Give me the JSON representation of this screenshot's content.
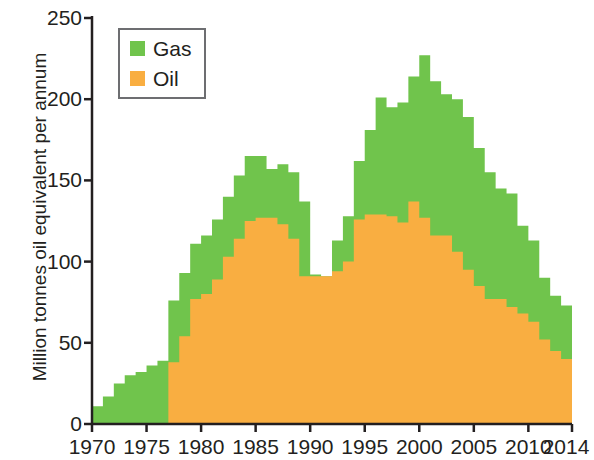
{
  "chart_data": {
    "type": "area",
    "title": "",
    "subtitle": "",
    "xlabel": "",
    "ylabel": "Million tonnes oil equivalent per annum",
    "stacked": true,
    "grid": false,
    "legend_position": "top-left",
    "xlim": [
      1970,
      2014
    ],
    "ylim": [
      0,
      250
    ],
    "ytick_labels": [
      "250",
      "200",
      "150",
      "100",
      "50",
      "0"
    ],
    "ytick_values": [
      250,
      200,
      150,
      100,
      50,
      0
    ],
    "xtick_labels": [
      "1970",
      "1975",
      "1980",
      "1985",
      "1990",
      "1995",
      "2000",
      "2005",
      "2010",
      "2014"
    ],
    "xtick_values": [
      1970,
      1975,
      1980,
      1985,
      1990,
      1995,
      2000,
      2005,
      2010,
      2014
    ],
    "x": [
      1970,
      1971,
      1972,
      1973,
      1974,
      1975,
      1976,
      1977,
      1978,
      1979,
      1980,
      1981,
      1982,
      1983,
      1984,
      1985,
      1986,
      1987,
      1988,
      1989,
      1990,
      1991,
      1992,
      1993,
      1994,
      1995,
      1996,
      1997,
      1998,
      1999,
      2000,
      2001,
      2002,
      2003,
      2004,
      2005,
      2006,
      2007,
      2008,
      2009,
      2010,
      2011,
      2012,
      2013
    ],
    "series": [
      {
        "name": "Oil",
        "color": "#F9AE41",
        "values": [
          0,
          0,
          0,
          0,
          0,
          0,
          0,
          38,
          54,
          77,
          80,
          89,
          103,
          114,
          125,
          127,
          127,
          123,
          114,
          91,
          91,
          91,
          94,
          100,
          126,
          129,
          129,
          128,
          124,
          137,
          127,
          116,
          116,
          106,
          95,
          85,
          77,
          77,
          72,
          68,
          63,
          52,
          45,
          40
        ]
      },
      {
        "name": "Gas",
        "color": "#70C44C",
        "values": [
          11,
          17,
          25,
          30,
          32,
          36,
          39,
          38,
          39,
          34,
          36,
          37,
          37,
          39,
          40,
          38,
          30,
          37,
          41,
          46,
          1,
          0,
          19,
          28,
          36,
          52,
          72,
          67,
          74,
          77,
          100,
          95,
          87,
          94,
          94,
          85,
          78,
          68,
          70,
          54,
          50,
          38,
          34,
          33
        ]
      }
    ],
    "totals": [
      11,
      17,
      25,
      30,
      32,
      36,
      39,
      76,
      93,
      111,
      116,
      126,
      140,
      153,
      165,
      165,
      157,
      160,
      155,
      137,
      92,
      91,
      113,
      128,
      162,
      181,
      201,
      195,
      198,
      214,
      227,
      211,
      203,
      200,
      189,
      170,
      155,
      145,
      142,
      122,
      113,
      90,
      79,
      73
    ]
  },
  "legend": {
    "items": [
      {
        "label": "Gas",
        "color": "#70C44C"
      },
      {
        "label": "Oil",
        "color": "#F9AE41"
      }
    ]
  },
  "axes": {
    "y_title": "Million tonnes oil equivalent per annum",
    "axis_color": "#231f20"
  }
}
